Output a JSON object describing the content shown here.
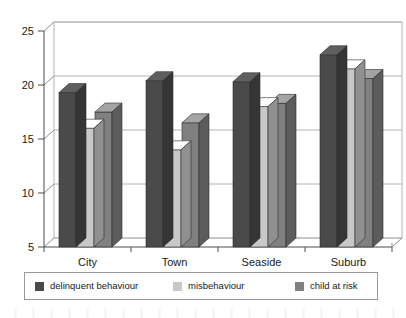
{
  "chart_data": {
    "type": "bar",
    "title": "",
    "xlabel": "",
    "ylabel": "",
    "categories": [
      "City",
      "Town",
      "Seaside",
      "Suburb"
    ],
    "series": [
      {
        "name": "delinquent behaviour",
        "color": "#4a4a4a",
        "values": [
          19.3,
          20.4,
          20.3,
          22.8
        ]
      },
      {
        "name": "misbehaviour",
        "color": "#c8c8c8",
        "values": [
          16.0,
          14.0,
          18.0,
          21.5
        ]
      },
      {
        "name": "child at risk",
        "color": "#808080",
        "values": [
          17.5,
          16.5,
          18.3,
          20.6
        ]
      }
    ],
    "ylim": [
      5,
      25
    ],
    "yticks": [
      5,
      10,
      15,
      20,
      25
    ],
    "ytick_labels": [
      "5",
      "10",
      "15",
      "20",
      "25"
    ],
    "grid": true,
    "legend_position": "bottom",
    "style": "3d-clustered-column"
  },
  "legend": {
    "entries": [
      {
        "label": "delinquent behaviour",
        "color": "#4a4a4a"
      },
      {
        "label": "misbehaviour",
        "color": "#c8c8c8"
      },
      {
        "label": "child at risk",
        "color": "#808080"
      }
    ]
  },
  "axis": {
    "y_tick_labels": [
      "25",
      "20",
      "15",
      "10",
      "5"
    ],
    "x_tick_labels": [
      "City",
      "Town",
      "Seaside",
      "Suburb"
    ]
  }
}
